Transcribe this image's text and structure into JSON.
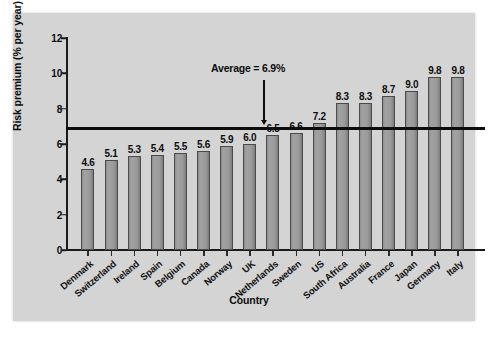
{
  "chart_data": {
    "type": "bar",
    "title": "",
    "xlabel": "Country",
    "ylabel": "Risk premium (% per year)",
    "ylim": [
      0,
      12
    ],
    "yticks": [
      0,
      2,
      4,
      6,
      8,
      10,
      12
    ],
    "ytick_labels": [
      "0",
      "2",
      "4",
      "6",
      "8",
      "10",
      "12"
    ],
    "grid": false,
    "legend": "none",
    "categories": [
      "Denmark",
      "Switzerland",
      "Ireland",
      "Spain",
      "Belgium",
      "Canada",
      "Norway",
      "UK",
      "Netherlands",
      "Sweden",
      "US",
      "South Africa",
      "Australia",
      "France",
      "Japan",
      "Germany",
      "Italy"
    ],
    "values": [
      4.6,
      5.1,
      5.3,
      5.4,
      5.5,
      5.6,
      5.9,
      6.0,
      6.5,
      6.6,
      7.2,
      8.3,
      8.3,
      8.7,
      9.0,
      9.8,
      9.8
    ],
    "value_labels": [
      "4.6",
      "5.1",
      "5.3",
      "5.4",
      "5.5",
      "5.6",
      "5.9",
      "6.0",
      "6.5",
      "6.6",
      "7.2",
      "8.3",
      "8.3",
      "8.7",
      "9.0",
      "9.8",
      "9.8"
    ],
    "bar_color": "#9a9a9a",
    "bar_edge_color": "#4a4a4a",
    "panel_color": "#d4d4d4",
    "annotations": [
      {
        "name": "average-reference-line",
        "label": "Average = 6.9%",
        "value": 6.9,
        "type": "hline",
        "color": "#0d0d0d"
      }
    ]
  },
  "axes": {
    "y_title": "Risk premium (% per year)",
    "x_title": "Country"
  },
  "annotation": {
    "average_text": "Average = 6.9%"
  }
}
